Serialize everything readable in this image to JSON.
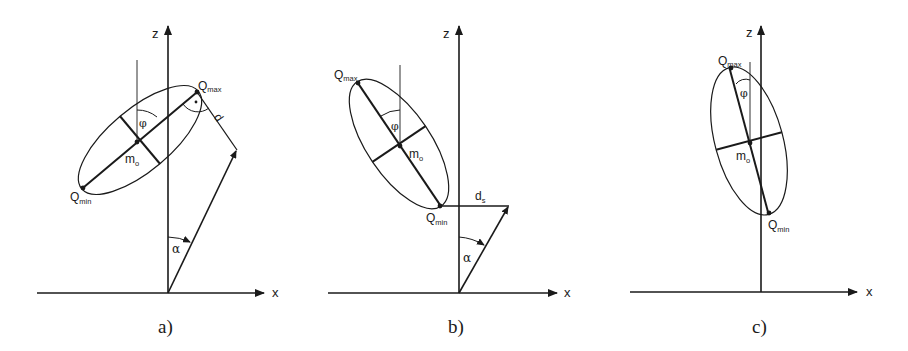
{
  "figure": {
    "panels": [
      {
        "id": "a",
        "caption": "a)",
        "axes": {
          "x_label": "x",
          "z_label": "z"
        },
        "labels": {
          "q_max": "Q",
          "q_max_sub": "max",
          "q_min": "Q",
          "q_min_sub": "min",
          "center": "m",
          "center_sub": "o",
          "angle_phi": "φ",
          "angle_alpha": "α",
          "distance": "d"
        }
      },
      {
        "id": "b",
        "caption": "b)",
        "axes": {
          "x_label": "x",
          "z_label": "z"
        },
        "labels": {
          "q_max": "Q",
          "q_max_sub": "max",
          "q_min": "Q",
          "q_min_sub": "min",
          "center": "m",
          "center_sub": "o",
          "angle_phi": "φ",
          "angle_alpha": "α",
          "distance": "d",
          "distance_sub": "s"
        }
      },
      {
        "id": "c",
        "caption": "c)",
        "axes": {
          "x_label": "x",
          "z_label": "z"
        },
        "labels": {
          "q_max": "Q",
          "q_max_sub": "max",
          "q_min": "Q",
          "q_min_sub": "min",
          "center": "m",
          "center_sub": "o",
          "angle_phi": "φ"
        }
      }
    ],
    "colors": {
      "line": "#1a1a1a",
      "background": "#ffffff"
    }
  }
}
